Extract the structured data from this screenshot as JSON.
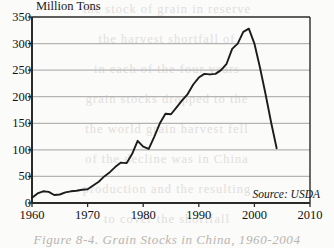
{
  "figure": {
    "y_axis_title": "Million Tons",
    "source_note": "Source: USDA",
    "caption": "Figure 8-4. Grain Stocks in China, 1960-2004",
    "line_color": "#1c1c1c",
    "grid_color": "#b4b4b4",
    "axis_color": "#2a2a2a"
  },
  "background_text": {
    "lines": [
      "the stock of grain in reserve",
      "the harvest shortfall of",
      "in each of the four years",
      "grain stocks dropped to the",
      "the world grain harvest fell",
      "of the decline was in China",
      "production and the resulting",
      "to cover the shortfall"
    ]
  },
  "chart_data": {
    "type": "line",
    "title": "",
    "xlabel": "",
    "ylabel": "Million Tons",
    "xlim": [
      1960,
      2010
    ],
    "ylim": [
      0,
      350
    ],
    "xticks": [
      1960,
      1970,
      1980,
      1990,
      2000,
      2010
    ],
    "yticks": [
      0,
      50,
      100,
      150,
      200,
      250,
      300,
      350
    ],
    "grid": "horizontal",
    "legend": "none",
    "annotations": [
      "Source: USDA"
    ],
    "series": [
      {
        "name": "Grain Stocks in China",
        "x": [
          1960,
          1961,
          1962,
          1963,
          1964,
          1965,
          1966,
          1967,
          1968,
          1969,
          1970,
          1971,
          1972,
          1973,
          1974,
          1975,
          1976,
          1977,
          1978,
          1979,
          1980,
          1981,
          1982,
          1983,
          1984,
          1985,
          1986,
          1987,
          1988,
          1989,
          1990,
          1991,
          1992,
          1993,
          1994,
          1995,
          1996,
          1997,
          1998,
          1999,
          2000,
          2001,
          2002,
          2003,
          2004
        ],
        "values": [
          10,
          18,
          22,
          21,
          15,
          16,
          20,
          22,
          23,
          25,
          26,
          33,
          40,
          50,
          58,
          68,
          76,
          75,
          92,
          117,
          106,
          102,
          125,
          150,
          168,
          167,
          180,
          193,
          205,
          223,
          236,
          243,
          242,
          243,
          250,
          262,
          290,
          300,
          322,
          328,
          300,
          255,
          205,
          152,
          103
        ]
      }
    ]
  }
}
